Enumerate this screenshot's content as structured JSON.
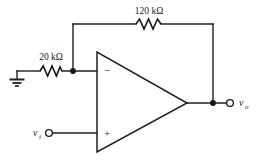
{
  "diagram": {
    "type": "schematic",
    "background_color": "#ffffff",
    "line_color": "#1f1f1f"
  },
  "components": {
    "input_resistor": {
      "label": "20 kΩ",
      "name": "input-resistor",
      "value": "20",
      "unit": "kΩ"
    },
    "feedback_resistor": {
      "label": "120 kΩ",
      "name": "feedback-resistor",
      "value": "120",
      "unit": "kΩ"
    },
    "opamp": {
      "inverting_sign": "−",
      "noninverting_sign": "+",
      "name": "operational-amplifier"
    },
    "ground": {
      "name": "ground-symbol",
      "label": ""
    }
  },
  "terminals": {
    "input": {
      "symbol": "v",
      "subscript": "i",
      "name": "input-terminal"
    },
    "output": {
      "symbol": "v",
      "subscript": "o",
      "name": "output-terminal"
    }
  },
  "nodes": {
    "inverting_node": "inverting-input-node",
    "output_node": "output-node"
  }
}
